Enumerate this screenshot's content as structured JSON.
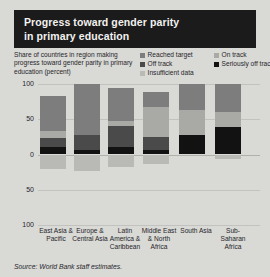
{
  "title": {
    "line1": "Progress toward gender parity",
    "line2": "in primary education"
  },
  "axis_note": "Share of countries in region making progress toward gender parity in primary education (percent)",
  "legend": {
    "column1": [
      {
        "label": "Reached target",
        "color": "#7d7d7d",
        "key": "reached_target"
      },
      {
        "label": "Off track",
        "color": "#4a4a4a",
        "key": "off_track"
      },
      {
        "label": "Insufficient data",
        "color": "#b9b9b5",
        "key": "insufficient_data"
      }
    ],
    "column2": [
      {
        "label": "On track",
        "color": "#a9a9a5",
        "key": "on_track"
      },
      {
        "label": "Seriously off track",
        "color": "#121212",
        "key": "seriously_off_track"
      }
    ]
  },
  "source": "Source: World Bank staff estimates.",
  "chart_data": {
    "type": "bar",
    "title": "Progress toward gender parity in primary education",
    "xlabel": "",
    "ylabel": "Share of countries in region making progress toward gender parity in primary education (percent)",
    "ylim": [
      -100,
      100
    ],
    "yticks": [
      100,
      50,
      0,
      50,
      100
    ],
    "ytick_labels": [
      "100",
      "50",
      "0",
      "50",
      "100"
    ],
    "grid": true,
    "legend_position": "top-right",
    "stacked": true,
    "note": "Positive axis stacks reached target / on track / off track / seriously off track upward; insufficient data plotted below the zero line.",
    "categories": [
      "East Asia & Pacific",
      "Europe & Central Asia",
      "Latin America & Caribbean",
      "Middle East & North Africa",
      "South Asia",
      "Sub-Saharan Africa"
    ],
    "series": [
      {
        "name": "Reached target",
        "color": "#7d7d7d",
        "values": [
          49,
          72,
          47,
          21,
          37,
          40
        ]
      },
      {
        "name": "On track",
        "color": "#a9a9a5",
        "values": [
          10,
          0,
          7,
          42,
          35,
          21
        ]
      },
      {
        "name": "Off track",
        "color": "#4a4a4a",
        "values": [
          14,
          21,
          30,
          18,
          0,
          0
        ]
      },
      {
        "name": "Seriously off track",
        "color": "#121212",
        "values": [
          10,
          7,
          10,
          7,
          28,
          39
        ]
      },
      {
        "name": "Insufficient data",
        "color": "#b9b9b5",
        "values": [
          -21,
          -24,
          -18,
          -14,
          0,
          -7
        ]
      }
    ]
  }
}
